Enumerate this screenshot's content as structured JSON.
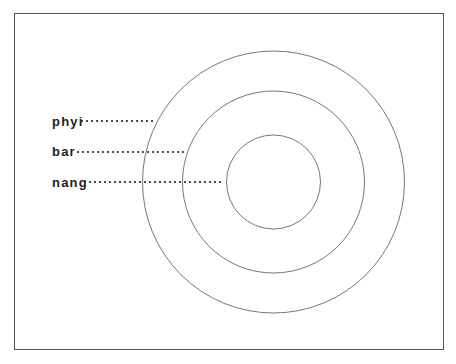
{
  "diagram": {
    "type": "concentric-circles",
    "center": {
      "x": 273.5,
      "y": 182
    },
    "line_color": "#777777",
    "text_color": "#222222",
    "circles": [
      {
        "name": "outer",
        "r": 131
      },
      {
        "name": "middle",
        "r": 91
      },
      {
        "name": "inner",
        "r": 47
      }
    ],
    "labels": [
      {
        "text": "phyi",
        "x": 52,
        "y": 126,
        "leader_start": 82,
        "leader_end": 153,
        "leader_y": 121,
        "target": "outer"
      },
      {
        "text": "bar",
        "x": 52,
        "y": 156,
        "leader_start": 78,
        "leader_end": 187,
        "leader_y": 152,
        "target": "middle"
      },
      {
        "text": "nang",
        "x": 52,
        "y": 187,
        "leader_start": 90,
        "leader_end": 222,
        "leader_y": 182,
        "target": "inner"
      }
    ]
  }
}
